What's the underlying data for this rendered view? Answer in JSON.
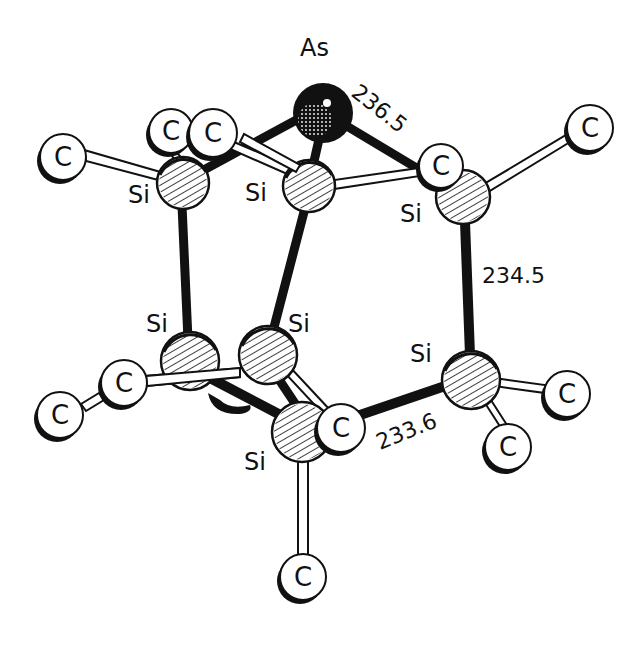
{
  "diagram": {
    "title": "",
    "colors": {
      "ink": "#111111",
      "paper": "#ffffff"
    },
    "atoms": [
      {
        "id": "As1",
        "element": "As",
        "label": "As",
        "x": 323,
        "y": 113,
        "r": 30,
        "style": "dark",
        "label_x": 300,
        "label_y": 56
      },
      {
        "id": "Si1",
        "element": "Si",
        "label": "Si",
        "x": 183,
        "y": 183,
        "r": 26,
        "style": "hatched",
        "label_x": 128,
        "label_y": 195
      },
      {
        "id": "Si2",
        "element": "Si",
        "label": "Si",
        "x": 309,
        "y": 186,
        "r": 26,
        "style": "hatched",
        "label_x": 245,
        "label_y": 193
      },
      {
        "id": "Si3",
        "element": "Si",
        "label": "Si",
        "x": 462,
        "y": 197,
        "r": 27,
        "style": "hatched",
        "label_x": 400,
        "label_y": 215
      },
      {
        "id": "Si4",
        "element": "Si",
        "label": "Si",
        "x": 190,
        "y": 361,
        "r": 29,
        "style": "hatched",
        "label_x": 146,
        "label_y": 325
      },
      {
        "id": "Si5",
        "element": "Si",
        "label": "Si",
        "x": 268,
        "y": 355,
        "r": 29,
        "style": "hatched",
        "label_x": 288,
        "label_y": 325
      },
      {
        "id": "Si6",
        "element": "Si",
        "label": "Si",
        "x": 471,
        "y": 380,
        "r": 29,
        "style": "hatched",
        "label_x": 410,
        "label_y": 355
      },
      {
        "id": "Si7",
        "element": "Si",
        "label": "Si",
        "x": 302,
        "y": 432,
        "r": 30,
        "style": "hatched",
        "label_x": 244,
        "label_y": 463
      }
    ],
    "carbons": [
      {
        "id": "C1",
        "label": "C",
        "x": 63,
        "y": 157,
        "r": 23
      },
      {
        "id": "C2",
        "label": "C",
        "x": 171,
        "y": 131,
        "r": 22
      },
      {
        "id": "C3",
        "label": "C",
        "x": 213,
        "y": 133,
        "r": 24
      },
      {
        "id": "C4",
        "label": "C",
        "x": 441,
        "y": 166,
        "r": 22
      },
      {
        "id": "C5",
        "label": "C",
        "x": 590,
        "y": 128,
        "r": 23
      },
      {
        "id": "C6",
        "label": "C",
        "x": 124,
        "y": 383,
        "r": 23
      },
      {
        "id": "C7",
        "label": "C",
        "x": 60,
        "y": 415,
        "r": 23
      },
      {
        "id": "C8",
        "label": "C",
        "x": 341,
        "y": 428,
        "r": 24
      },
      {
        "id": "C9",
        "label": "C",
        "x": 567,
        "y": 394,
        "r": 23
      },
      {
        "id": "C10",
        "label": "C",
        "x": 508,
        "y": 447,
        "r": 23
      },
      {
        "id": "C11",
        "label": "C",
        "x": 303,
        "y": 577,
        "r": 23
      }
    ],
    "bond_labels": [
      {
        "id": "d_As_Si",
        "text": "236.5",
        "x": 350,
        "y": 95,
        "rotate": 38
      },
      {
        "id": "d_Si_Si_vertical",
        "text": "234.5",
        "x": 482,
        "y": 283,
        "rotate": 0
      },
      {
        "id": "d_Si_Si_bottom",
        "text": "233.6",
        "x": 380,
        "y": 445,
        "rotate": -22
      }
    ]
  }
}
